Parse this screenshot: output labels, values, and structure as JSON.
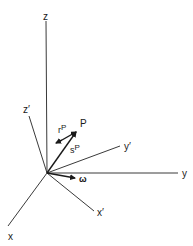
{
  "diagram": {
    "type": "rotating-frame-coordinate-diagram",
    "origin": {
      "x": 47,
      "y": 173
    },
    "axes": [
      {
        "id": "z",
        "label": "z",
        "end": {
          "x": 46,
          "y": 21
        },
        "label_pos": {
          "x": 43,
          "y": 20
        }
      },
      {
        "id": "y",
        "label": "y",
        "end": {
          "x": 178,
          "y": 173
        },
        "label_pos": {
          "x": 183,
          "y": 177
        }
      },
      {
        "id": "x",
        "label": "x",
        "end": {
          "x": 8,
          "y": 226
        },
        "label_pos": {
          "x": 8,
          "y": 240
        }
      },
      {
        "id": "z-prime",
        "label": "z′",
        "end": {
          "x": 29,
          "y": 116
        },
        "label_pos": {
          "x": 23,
          "y": 112
        }
      },
      {
        "id": "y-prime",
        "label": "y′",
        "end": {
          "x": 120,
          "y": 146
        },
        "label_pos": {
          "x": 124,
          "y": 150
        }
      },
      {
        "id": "x-prime",
        "label": "x′",
        "end": {
          "x": 94,
          "y": 211
        },
        "label_pos": {
          "x": 97,
          "y": 216
        }
      }
    ],
    "vectors": [
      {
        "id": "s-P",
        "label": "s",
        "superscript": "P",
        "from": {
          "x": 47,
          "y": 173
        },
        "to": {
          "x": 77,
          "y": 131
        },
        "label_pos": {
          "x": 70,
          "y": 152
        }
      },
      {
        "id": "r-P",
        "label": "r",
        "superscript": "P",
        "from": {
          "x": 77,
          "y": 132
        },
        "to": {
          "x": 56,
          "y": 143
        },
        "label_pos": {
          "x": 59,
          "y": 131
        }
      },
      {
        "id": "omega",
        "label": "ω",
        "from": {
          "x": 47,
          "y": 173
        },
        "to": {
          "x": 75,
          "y": 178
        },
        "label_pos": {
          "x": 80,
          "y": 181
        }
      }
    ],
    "points": [
      {
        "id": "P",
        "label": "P",
        "label_pos": {
          "x": 80,
          "y": 126
        }
      }
    ],
    "colors": {
      "line": "#3a3a3a",
      "vector": "#1a1a1a",
      "background": "#ffffff"
    }
  }
}
